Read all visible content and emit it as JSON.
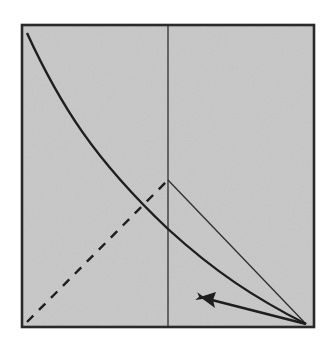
{
  "diagram": {
    "colors": {
      "background": "#ffffff",
      "panel_fill": "#c8c8c8",
      "frame_stroke": "#2a2a2a",
      "curve_stroke": "#1e1e1e",
      "thin_line_stroke": "#2e2e2e",
      "dashed_stroke": "#1e1e1e",
      "arrow_stroke": "#1e1e1e"
    },
    "frame": {
      "x": 22,
      "y": 25,
      "width": 292,
      "height": 302
    },
    "vertical_line": {
      "x": 168,
      "y1": 25,
      "y2": 327
    },
    "curve": {
      "type": "convex-decreasing",
      "points": [
        [
          27,
          33
        ],
        [
          60,
          100
        ],
        [
          80,
          135
        ],
        [
          100,
          160
        ],
        [
          120,
          182
        ],
        [
          145,
          207
        ],
        [
          168,
          229
        ],
        [
          195,
          253
        ],
        [
          225,
          276
        ],
        [
          260,
          298
        ],
        [
          305,
          324
        ]
      ]
    },
    "dashed_line": {
      "x1": 27,
      "y1": 322,
      "x2": 168,
      "y2": 180
    },
    "triangle_edge": {
      "x1": 168,
      "y1": 180,
      "x2": 306,
      "y2": 324
    },
    "arrow": {
      "x1": 306,
      "y1": 324,
      "x2": 202,
      "y2": 298
    }
  }
}
